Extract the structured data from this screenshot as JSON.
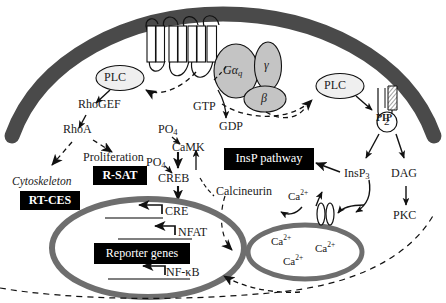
{
  "figure": {
    "colors": {
      "membrane": "#4a4a4a",
      "nucleus_border": "#6e6e6e",
      "calcium_store_border": "#6e6e6e",
      "protein_fill": "#c4c4c4",
      "plc_fill": "#eeeeee",
      "box_bg": "#000000",
      "box_text": "#ffffff",
      "stroke": "#1a1a1a"
    }
  },
  "membrane": {
    "receptor_name": "seven-transmembrane-receptor",
    "pip2": {
      "top_label": "PIP",
      "bottom_label": "2"
    }
  },
  "proteins": {
    "plc_left": "PLC",
    "plc_right": "PLC",
    "g_alpha_q": "Gα",
    "g_alpha_q_sub": "q",
    "g_gamma": "γ",
    "g_beta": "β"
  },
  "nucleotides": {
    "gtp": "GTP",
    "gdp": "GDP"
  },
  "left_branch": {
    "rhogef": "RhoGEF",
    "rhoa": "RhoA",
    "proliferation": "Proliferation",
    "r_sat_box": "R-SAT",
    "cytoskeleton": "Cytoskeleton",
    "rt_ces_box": "RT-CES"
  },
  "camk_branch": {
    "po4_upper": "PO",
    "po4_upper_sub": "4",
    "camk": "CaMK",
    "po4_lower": "PO",
    "po4_lower_sub": "4",
    "creb": "CREB"
  },
  "insp_branch": {
    "insp_pathway_box": "InsP pathway",
    "insp3": "InsP",
    "insp3_sub": "3",
    "dag": "DAG",
    "pkc": "PKC"
  },
  "calcium": {
    "calcineurin": "Calcineurin",
    "ca_free": "Ca",
    "ca_sup": "2+",
    "store_ions": [
      {
        "label": "Ca",
        "sup": "2+"
      },
      {
        "label": "Ca",
        "sup": "2+"
      },
      {
        "label": "Ca",
        "sup": "2+"
      }
    ],
    "channel_name": "calcium-channel"
  },
  "nucleus": {
    "reporter_genes_box": "Reporter genes",
    "promoters": [
      {
        "label": "CRE"
      },
      {
        "label": "NFAT"
      },
      {
        "label": "NF-κB"
      }
    ]
  }
}
